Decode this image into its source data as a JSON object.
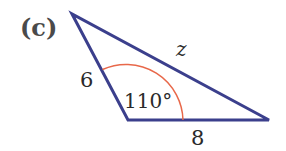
{
  "figure": {
    "part_label": "(c)",
    "side_labels": {
      "left": "6",
      "bottom": "8",
      "hypotenuse": "z"
    },
    "angle_label": "110°",
    "colors": {
      "triangle_stroke": "#3b3f8c",
      "arc_stroke": "#e8684a"
    }
  }
}
